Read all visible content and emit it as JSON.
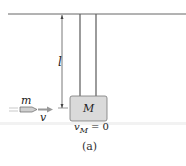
{
  "diagram": {
    "labels": {
      "bullet_mass": "m",
      "bullet_velocity": "v",
      "block_mass": "M",
      "length": "l",
      "block_velocity_sym": "v",
      "block_velocity_sub": "M",
      "block_velocity_eq": " = 0"
    },
    "caption": "(a)",
    "colors": {
      "block_fill": "#d9d9d9",
      "line": "#555555",
      "bullet_fill": "#cccccc",
      "arrow": "#999999"
    }
  }
}
